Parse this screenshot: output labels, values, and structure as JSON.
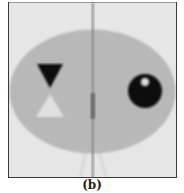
{
  "figure": {
    "caption": "(b)",
    "colors": {
      "background": "#e6e6e6",
      "frame": "#3a3a3a",
      "ellipse": "#b8b8b8",
      "dark_triangle": "#0f0f0f",
      "light_triangle": "#e0e0e0",
      "disk": "#0a0a0a",
      "disk_highlight": "#e8e8e8",
      "streak": "#8a8a8a",
      "streak_dense": "#6e6e6e"
    }
  }
}
